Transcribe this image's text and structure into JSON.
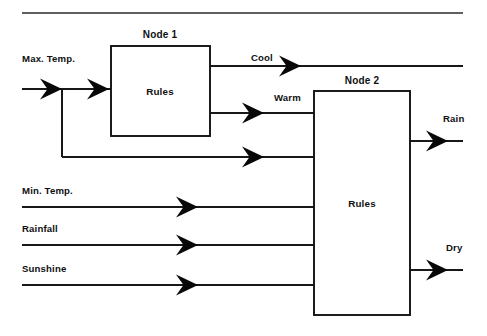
{
  "diagram": {
    "type": "block-flow-diagram",
    "canvas": {
      "width": 487,
      "height": 336,
      "background": "#ffffff"
    },
    "colors": {
      "line": "#18181a",
      "arrow": "#080808",
      "box_stroke": "#111113",
      "box_fill": "#ffffff",
      "text": "#101012",
      "top_rule": "#2a2a2c"
    },
    "top_rule": {
      "x1": 22,
      "x2": 463,
      "y": 13
    },
    "nodes": [
      {
        "id": "node1",
        "title": "Node 1",
        "body_label": "Rules",
        "x": 111,
        "y": 46,
        "width": 99,
        "height": 90,
        "title_x": 160,
        "title_y": 38,
        "body_x": 160,
        "body_y": 95
      },
      {
        "id": "node2",
        "title": "Node 2",
        "body_label": "Rules",
        "x": 314,
        "y": 91,
        "width": 96,
        "height": 224,
        "title_x": 362,
        "title_y": 84,
        "body_x": 362,
        "body_y": 207
      }
    ],
    "inputs": [
      {
        "id": "max-temp",
        "label": "Max. Temp.",
        "label_x": 22,
        "label_y": 62,
        "line_y": 89
      },
      {
        "id": "min-temp",
        "label": "Min. Temp.",
        "label_x": 22,
        "label_y": 194,
        "line_y": 207
      },
      {
        "id": "rainfall",
        "label": "Rainfall",
        "label_x": 22,
        "label_y": 232,
        "line_y": 245
      },
      {
        "id": "sunshine",
        "label": "Sunshine",
        "label_x": 22,
        "label_y": 272,
        "line_y": 285
      }
    ],
    "intermediate_labels": [
      {
        "id": "cool",
        "label": "Cool",
        "x": 251,
        "y": 61,
        "line_y": 66
      },
      {
        "id": "warm",
        "label": "Warm",
        "x": 274,
        "y": 101,
        "line_y": 113
      }
    ],
    "outputs": [
      {
        "id": "rain",
        "label": "Rain",
        "x": 443,
        "y": 122,
        "line_y": 141
      },
      {
        "id": "dry",
        "label": "Dry",
        "x": 446,
        "y": 251,
        "line_y": 270
      }
    ],
    "bypass": {
      "id": "max-temp-bypass",
      "branch_x": 62,
      "from_y": 89,
      "to_y": 157,
      "end_x": 314
    },
    "arrow_markers": [
      {
        "id": "arrow-max-temp-in",
        "tip_x": 62,
        "y": 89
      },
      {
        "id": "arrow-node1-in",
        "tip_x": 108,
        "y": 89
      },
      {
        "id": "arrow-cool-out",
        "tip_x": 301,
        "y": 66
      },
      {
        "id": "arrow-warm-out",
        "tip_x": 262,
        "y": 113
      },
      {
        "id": "arrow-bypass-in",
        "tip_x": 262,
        "y": 157
      },
      {
        "id": "arrow-min-temp-in",
        "tip_x": 196,
        "y": 207
      },
      {
        "id": "arrow-rainfall-in",
        "tip_x": 196,
        "y": 245
      },
      {
        "id": "arrow-sunshine-in",
        "tip_x": 196,
        "y": 285
      },
      {
        "id": "arrow-rain-out",
        "tip_x": 448,
        "y": 141
      },
      {
        "id": "arrow-dry-out",
        "tip_x": 448,
        "y": 270
      }
    ]
  }
}
